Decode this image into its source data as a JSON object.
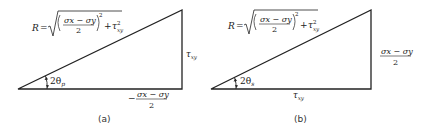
{
  "figure": {
    "panels": [
      {
        "id": "a",
        "caption": "(a)",
        "hypotenuse_label": {
          "lhs": "R",
          "eq": "=",
          "num": "σx − σy",
          "den": "2",
          "exp": "2",
          "plus": "+",
          "tau": "τ",
          "tau_sub": "xy",
          "tau_sup": "2"
        },
        "vertical_side_label": {
          "sym": "τ",
          "sub": "xy"
        },
        "horizontal_side_label": {
          "sign": "−",
          "num": "σx − σy",
          "den": "2"
        },
        "angle_label": {
          "text": "2θ",
          "sub": "p"
        }
      },
      {
        "id": "b",
        "caption": "(b)",
        "hypotenuse_label": {
          "lhs": "R",
          "eq": "=",
          "num": "σx − σy",
          "den": "2",
          "exp": "2",
          "plus": "+",
          "tau": "τ",
          "tau_sub": "xy",
          "tau_sup": "2"
        },
        "vertical_side_label": {
          "num": "σx − σy",
          "den": "2"
        },
        "horizontal_side_label": {
          "sym": "τ",
          "sub": "xy"
        },
        "angle_label": {
          "text": "2θ",
          "sub": "s"
        }
      }
    ],
    "colors": {
      "stroke": "#222222",
      "background": "#ffffff"
    }
  }
}
